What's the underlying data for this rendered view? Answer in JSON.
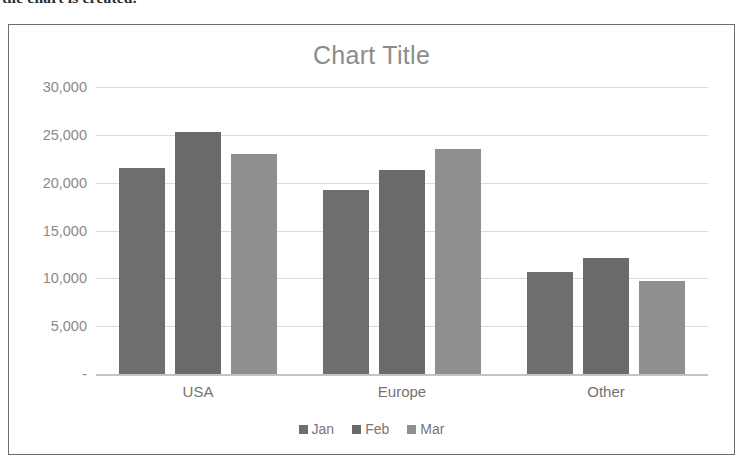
{
  "document": {
    "cutoff_text": "the chart is created."
  },
  "chart_data": {
    "type": "bar",
    "title": "Chart Title",
    "xlabel": "",
    "ylabel": "",
    "categories": [
      "USA",
      "Europe",
      "Other"
    ],
    "series": [
      {
        "name": "Jan",
        "values": [
          21500,
          19200,
          10700
        ],
        "color": "#6e6e6e"
      },
      {
        "name": "Feb",
        "values": [
          25300,
          21300,
          12100
        ],
        "color": "#6a6a6a"
      },
      {
        "name": "Mar",
        "values": [
          23000,
          23500,
          9700
        ],
        "color": "#8f8f8f"
      }
    ],
    "ylim": [
      0,
      30000
    ],
    "ytick_values": [
      30000,
      25000,
      20000,
      15000,
      10000,
      5000,
      0
    ],
    "ytick_labels": [
      "30,000",
      "25,000",
      "20,000",
      "15,000",
      "10,000",
      "5,000",
      "-"
    ],
    "grid": true,
    "legend_position": "bottom",
    "title_color": "#8c8c8c",
    "axis_text_color": "#8a8a8a",
    "gridline_color": "#dcdcdc",
    "frame_color": "#6e6e6e",
    "plot_background": "#ffffff"
  }
}
